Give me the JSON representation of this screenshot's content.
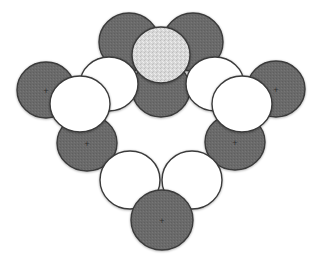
{
  "diagram": {
    "type": "space-filling molecular model",
    "colors": {
      "background": "#ffffff",
      "dark_atom": "#6a6a6a",
      "light_atom": "#ffffff",
      "central_atom": "#d6d6d6",
      "outline": "#3a3a3a",
      "marker": "#2a2a2a"
    },
    "atoms": [
      {
        "id": "top-left-dark",
        "kind": "dark",
        "cx": 129,
        "cy": 42,
        "rx": 30,
        "ry": 29,
        "marker": false
      },
      {
        "id": "top-right-dark",
        "kind": "dark",
        "cy": 42,
        "cx": 193,
        "rx": 30,
        "ry": 29,
        "marker": false
      },
      {
        "id": "center-dark",
        "kind": "dark",
        "cx": 161,
        "cy": 89,
        "rx": 29,
        "ry": 28,
        "marker": false
      },
      {
        "id": "left-far-dark",
        "kind": "dark",
        "cx": 46,
        "cy": 90,
        "rx": 29,
        "ry": 28,
        "marker": true
      },
      {
        "id": "right-far-dark",
        "kind": "dark",
        "cx": 276,
        "cy": 89,
        "rx": 29,
        "ry": 28,
        "marker": true
      },
      {
        "id": "left-back-light",
        "kind": "light",
        "cx": 109,
        "cy": 84,
        "rx": 29,
        "ry": 27,
        "marker": false
      },
      {
        "id": "right-back-light",
        "kind": "light",
        "cx": 215,
        "cy": 84,
        "rx": 29,
        "ry": 27,
        "marker": false
      },
      {
        "id": "central-speckled",
        "kind": "central",
        "cx": 161,
        "cy": 55,
        "rx": 29,
        "ry": 28,
        "marker": false
      },
      {
        "id": "left-lower-dark",
        "kind": "dark",
        "cx": 87,
        "cy": 143,
        "rx": 30,
        "ry": 28,
        "marker": true
      },
      {
        "id": "right-lower-dark",
        "kind": "dark",
        "cx": 235,
        "cy": 142,
        "rx": 30,
        "ry": 28,
        "marker": true
      },
      {
        "id": "left-front-light",
        "kind": "light",
        "cx": 80,
        "cy": 104,
        "rx": 30,
        "ry": 28,
        "marker": false
      },
      {
        "id": "right-front-light",
        "kind": "light",
        "cx": 242,
        "cy": 104,
        "rx": 30,
        "ry": 28,
        "marker": false
      },
      {
        "id": "bottom-left-light",
        "kind": "light",
        "cx": 130,
        "cy": 180,
        "rx": 30,
        "ry": 29,
        "marker": false
      },
      {
        "id": "bottom-right-light",
        "kind": "light",
        "cx": 192,
        "cy": 180,
        "rx": 30,
        "ry": 29,
        "marker": false
      },
      {
        "id": "bottom-dark",
        "kind": "dark",
        "cx": 162,
        "cy": 220,
        "rx": 31,
        "ry": 30,
        "marker": true
      }
    ]
  }
}
